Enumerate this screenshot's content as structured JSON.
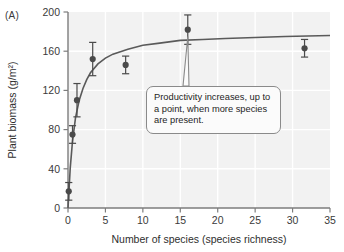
{
  "panel": {
    "label": "(A)"
  },
  "chart_data": {
    "type": "scatter",
    "title": "",
    "subtitle": "",
    "xlabel": "Number of species (species richness)",
    "ylabel": "Plant biomass (g/m²)",
    "xlim": [
      0,
      35
    ],
    "ylim": [
      0,
      200
    ],
    "xticks": [
      0,
      5,
      10,
      15,
      20,
      25,
      30,
      35
    ],
    "yticks": [
      0,
      40,
      80,
      120,
      160,
      200
    ],
    "grid": true,
    "legend": null,
    "x": [
      0.1,
      0.6,
      1.2,
      3.3,
      7.7,
      16.0,
      31.6
    ],
    "values": [
      17,
      75,
      110,
      152,
      146,
      182,
      163
    ],
    "yerr_upper": [
      9,
      9,
      17,
      17,
      9,
      15,
      9
    ],
    "yerr_lower": [
      9,
      9,
      17,
      17,
      9,
      15,
      9
    ],
    "series": [
      {
        "name": "Plant biomass",
        "x": [
          0.1,
          0.6,
          1.2,
          3.3,
          7.7,
          16.0,
          31.6
        ],
        "values": [
          17,
          75,
          110,
          152,
          146,
          182,
          163
        ],
        "yerr": [
          9,
          9,
          17,
          17,
          9,
          15,
          9
        ]
      },
      {
        "name": "Fitted saturating curve",
        "type": "line",
        "x": [
          0.0,
          0.3,
          0.6,
          1.0,
          1.5,
          2.0,
          2.5,
          3.0,
          4.0,
          5.0,
          6.0,
          8.0,
          10.0,
          12.0,
          15.0,
          18.0,
          21.0,
          25.0,
          29.0,
          35.0
        ],
        "values": [
          0,
          41,
          68,
          92,
          110,
          122,
          131,
          138,
          147,
          153,
          157,
          162,
          166,
          168,
          171,
          172,
          173,
          174,
          175,
          176
        ]
      }
    ],
    "annotations": [
      {
        "text": "Productivity increases, up to a point, when more species are present.",
        "points_to_x": 16.0,
        "points_to_y": 175
      }
    ]
  },
  "colors": {
    "plot_background": "#f2f2f2",
    "gridline": "#ffffff",
    "axis": "#7d7d7d",
    "marker": "#4a4a4a",
    "curve": "#5a5a5a",
    "text": "#2e2e2e",
    "callout_border": "#8a8a8a",
    "callout_background": "#fbfbfb"
  },
  "annotation": {
    "text": "Productivity increases, up to a point, when more species are present."
  }
}
